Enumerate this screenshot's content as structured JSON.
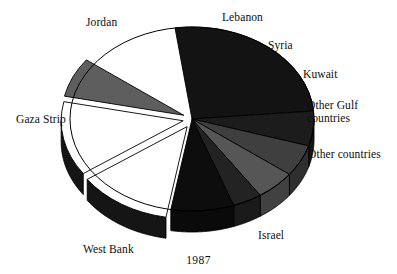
{
  "caption": "1987",
  "chart_data": {
    "type": "pie",
    "title": "",
    "subtitle": "",
    "xlabel": "",
    "ylabel": "",
    "legend_position": "labels-around-pie",
    "grid": false,
    "style": "3d-exploded-pie",
    "categories": [
      "Jordan",
      "Lebanon",
      "Syria",
      "Kuwait",
      "Other Gulf countries",
      "Other countries",
      "Israel",
      "West Bank",
      "Gaza Strip"
    ],
    "values": [
      33,
      6,
      6,
      6,
      5,
      9.5,
      13,
      14,
      7.5
    ],
    "units": "percent",
    "slices": [
      {
        "label": "Jordan",
        "value": 33,
        "color": "#131313",
        "start_angle": 262,
        "end_angle": 355,
        "exploded": false
      },
      {
        "label": "Lebanon",
        "value": 6,
        "color": "#1c1c1c",
        "start_angle": 355,
        "end_angle": 17,
        "exploded": false
      },
      {
        "label": "Syria",
        "value": 6,
        "color": "#3f3f3f",
        "start_angle": 17,
        "end_angle": 37,
        "exploded": false
      },
      {
        "label": "Kuwait",
        "value": 6,
        "color": "#565656",
        "start_angle": 37,
        "end_angle": 56,
        "exploded": false
      },
      {
        "label": "Other Gulf countries",
        "value": 5,
        "color": "#232323",
        "start_angle": 56,
        "end_angle": 70,
        "exploded": false
      },
      {
        "label": "Other countries",
        "value": 9.5,
        "color": "#0d0d0d",
        "start_angle": 70,
        "end_angle": 100,
        "exploded": false
      },
      {
        "label": "Israel",
        "value": 13,
        "color": "#ffffff",
        "start_angle": 100,
        "end_angle": 145,
        "exploded": true
      },
      {
        "label": "West Bank",
        "value": 14,
        "color": "#ffffff",
        "start_angle": 145,
        "end_angle": 192,
        "exploded": true
      },
      {
        "label": "Gaza Strip",
        "value": 7.5,
        "color": "#5e5e5e",
        "start_angle": 192,
        "end_angle": 217,
        "exploded": true
      }
    ]
  },
  "labels": {
    "jordan": "Jordan",
    "lebanon": "Lebanon",
    "syria": "Syria",
    "kuwait": "Kuwait",
    "other_gulf_line1": "Other Gulf",
    "other_gulf_line2": "countries",
    "other_countries": "Other countries",
    "gaza_strip": "Gaza Strip",
    "west_bank": "West Bank",
    "israel": "Israel"
  },
  "colors": {
    "background": "#ffffff",
    "outline": "#000000",
    "text": "#0d0d0d",
    "slice_black": "#131313",
    "slice_white": "#ffffff",
    "slice_gray_mid": "#3f3f3f",
    "slice_gray_light": "#5e5e5e",
    "rim_dark": "#151515"
  }
}
